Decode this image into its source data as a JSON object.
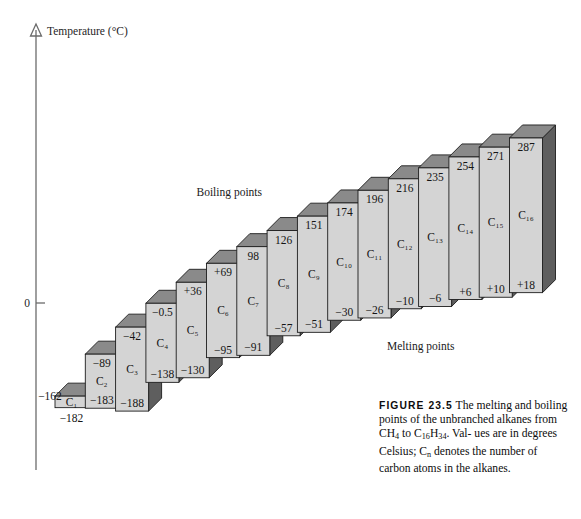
{
  "figure": {
    "axis_title": "Temperature (°C)",
    "zero_tick": "0",
    "boiling_label": "Boiling points",
    "melting_label": "Melting points"
  },
  "caption": {
    "figure_number": "FIGURE 23.5",
    "line1": "The melting and",
    "line2": "boiling points of the unbranched",
    "line3_a": "alkanes from CH",
    "line3_sub1": "4",
    "line3_b": " to C",
    "line3_sub2": "16",
    "line3_c": "H",
    "line3_sub3": "34",
    "line3_d": ". Val-",
    "line4_a": "ues are in degrees Celsius; C",
    "line4_sub": "n",
    "line5": "denotes the number of carbon",
    "line6": "atoms in the alkanes."
  },
  "chart_data": {
    "type": "bar",
    "title": "The melting and boiling points of the unbranched alkanes from CH4 to C16H34",
    "xlabel": "",
    "ylabel": "Temperature (°C)",
    "ylim": [
      -190,
      290
    ],
    "grid": false,
    "legend": [
      "Boiling points",
      "Melting points"
    ],
    "legend_position": "inline-annotations",
    "categories": [
      "C1",
      "C2",
      "C3",
      "C4",
      "C5",
      "C6",
      "C7",
      "C8",
      "C9",
      "C10",
      "C11",
      "C12",
      "C13",
      "C14",
      "C15",
      "C16"
    ],
    "category_labels": [
      "C₁",
      "C₂",
      "C₃",
      "C₄",
      "C₅",
      "C₆",
      "C₇",
      "C₈",
      "C₉",
      "C₁₀",
      "C₁₁",
      "C₁₂",
      "C₁₃",
      "C₁₄",
      "C₁₅",
      "C₁₆"
    ],
    "series": [
      {
        "name": "Boiling points",
        "values": [
          -162,
          -89,
          -42,
          -0.5,
          36,
          69,
          98,
          126,
          151,
          174,
          196,
          216,
          235,
          254,
          271,
          287
        ],
        "labels": [
          "−162",
          "−89",
          "−42",
          "−0.5",
          "+36",
          "+69",
          "98",
          "126",
          "151",
          "174",
          "196",
          "216",
          "235",
          "254",
          "271",
          "287"
        ]
      },
      {
        "name": "Melting points",
        "values": [
          -182,
          -183,
          -188,
          -138,
          -130,
          -95,
          -91,
          -57,
          -51,
          -30,
          -26,
          -10,
          -6,
          6,
          10,
          18
        ],
        "labels": [
          "−182",
          "−183",
          "−188",
          "−138",
          "−130",
          "−95",
          "−91",
          "−57",
          "−51",
          "−30",
          "−26",
          "−10",
          "−6",
          "+6",
          "+10",
          "+18"
        ]
      }
    ]
  },
  "style": {
    "bar_face": "#d4d4d4",
    "bar_top": "#8a8a8a",
    "bar_side": "#5e5e5e",
    "bar_stroke": "#1d1d1d",
    "axis_color": "#6b6b6b",
    "background": "#ffffff"
  }
}
